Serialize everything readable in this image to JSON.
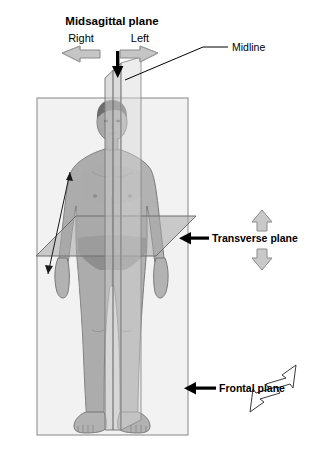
{
  "diagram": {
    "labels": {
      "midsagittal_plane": "Midsagittal plane",
      "right": "Right",
      "left": "Left",
      "midline": "Midline",
      "transverse_plane": "Transverse plane",
      "frontal_plane": "Frontal plane"
    },
    "colors": {
      "background": "#ffffff",
      "text": "#000000",
      "frontal_plane_fill": "#f2f2f2",
      "frontal_plane_stroke": "#9a9a9a",
      "sagittal_plane_fill": "#c9c9c9",
      "sagittal_plane_stroke": "#7d7d7d",
      "transverse_plane_fill": "#a8a8a8",
      "transverse_plane_stroke": "#6e6e6e",
      "body_fill": "#b0b0b0",
      "body_shade": "#8e8e8e",
      "body_outline": "#6b6b6b",
      "hair": "#6f6f6f",
      "arrow_gray_fill": "#c0c0c0",
      "arrow_gray_stroke": "#808080",
      "arrow_white_fill": "#ffffff",
      "arrow_black": "#000000"
    },
    "elements": {
      "down_arrow": "black downward arrow marking the midsagittal plane",
      "right_arrow": "gray block arrow pointing left toward Right side",
      "left_arrow": "gray block arrow pointing right toward Left side",
      "transverse_up_arrow": "gray outlined arrow pointing up",
      "transverse_down_arrow": "gray outlined arrow pointing down",
      "frontal_up_arrow": "white outlined arrow pointing up-right",
      "frontal_down_arrow": "white outlined arrow pointing down-left",
      "arm_arrow": "thin double-headed arrow along the left arm",
      "midline_leader": "leader line from Midline label to top of midsagittal plane",
      "transverse_leader": "black arrow pointing left at transverse plane",
      "frontal_leader": "black arrow pointing left at frontal plane"
    }
  }
}
